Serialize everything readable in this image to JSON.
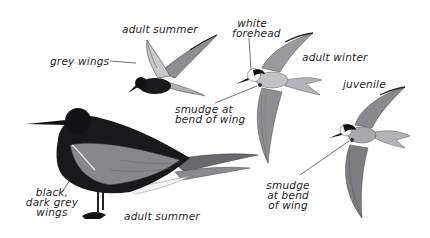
{
  "plate": {
    "subject": "black tern plumages",
    "colors": {
      "black_body": "#17171a",
      "dark_grey_wing": "#5c5c60",
      "mid_grey_wing": "#8e8e92",
      "light_grey": "#b9b9bc",
      "white": "#f4f4f4",
      "ink": "#1e1e1e"
    }
  },
  "labels": {
    "adult_summer_flying": "adult summer",
    "grey_wings": "grey wings",
    "white_forehead_line1": "white",
    "white_forehead_line2": "forehead",
    "adult_winter": "adult winter",
    "juvenile": "juvenile",
    "smudge_winter_line1": "smudge at",
    "smudge_winter_line2": "bend of wing",
    "smudge_juv_line1": "smudge",
    "smudge_juv_line2": "at bend",
    "smudge_juv_line3": "of wing",
    "black_wings_line1": "black,",
    "black_wings_line2": "dark grey",
    "black_wings_line3": "wings",
    "adult_summer_standing": "adult summer"
  }
}
